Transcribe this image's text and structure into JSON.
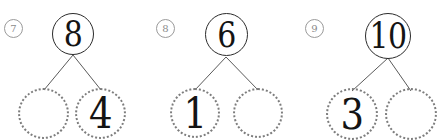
{
  "worksheet": {
    "title": "Number bond practice",
    "background_color": "#ffffff",
    "ink_color": "#141414",
    "dotted_circle_color": "#7d7d7d",
    "solid_circle_color": "#2b2b2b",
    "line_color": "#5a5a5a",
    "problem_number_color": "#8a8a8a"
  },
  "problems": [
    {
      "number": "7",
      "whole": {
        "value": "8",
        "filled": true
      },
      "parts": [
        {
          "value": "",
          "filled": false
        },
        {
          "value": "4",
          "filled": true
        }
      ]
    },
    {
      "number": "8",
      "whole": {
        "value": "6",
        "filled": true
      },
      "parts": [
        {
          "value": "1",
          "filled": true
        },
        {
          "value": "",
          "filled": false
        }
      ]
    },
    {
      "number": "9",
      "whole": {
        "value": "10",
        "filled": true
      },
      "parts": [
        {
          "value": "3",
          "filled": true
        },
        {
          "value": "",
          "filled": false
        }
      ]
    }
  ]
}
